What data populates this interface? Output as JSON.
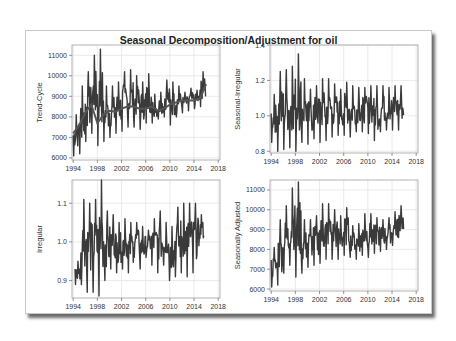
{
  "title": "Seasonal Decomposition/Adjustment  for oil",
  "colors": {
    "line": "#3a3a3a",
    "trend": "#555555",
    "grid": "#e4e4e4",
    "axis": "#a0a0a0"
  },
  "chart_data": [
    {
      "type": "line",
      "panel": "top-left",
      "ylabel": "Trend-Cycle",
      "xlabel": "",
      "x_ticks": [
        1994,
        1998,
        2002,
        2006,
        2010,
        2014,
        2018
      ],
      "y_ticks": [
        6000,
        7000,
        8000,
        9000,
        10000,
        11000
      ],
      "xlim": [
        1993.8,
        2018.3
      ],
      "ylim": [
        5900,
        11500
      ],
      "series": [
        {
          "name": "Original",
          "x_start": 1994,
          "x_end": 2016,
          "peaks": [
            8100,
            9500,
            10200,
            11000,
            11300,
            9500,
            9500,
            9700,
            10200,
            10300,
            10000,
            9700,
            10100,
            9100,
            9200,
            9800,
            9700,
            9500,
            9200,
            9400,
            9300,
            10200
          ],
          "troughs": [
            6100,
            6200,
            6800,
            7200,
            6600,
            6800,
            7000,
            7200,
            7300,
            7500,
            7500,
            7400,
            7700,
            7700,
            7900,
            8000,
            7600,
            8000,
            8200,
            8300,
            8400,
            8500
          ]
        },
        {
          "name": "Trend-Cycle",
          "points": [
            [
              1994,
              7200
            ],
            [
              1995,
              7600
            ],
            [
              1996,
              8200
            ],
            [
              1997,
              8600
            ],
            [
              1998,
              7700
            ],
            [
              1999,
              8100
            ],
            [
              2000,
              8300
            ],
            [
              2001,
              8250
            ],
            [
              2002,
              8400
            ],
            [
              2003,
              8500
            ],
            [
              2004,
              8500
            ],
            [
              2005,
              8400
            ],
            [
              2006,
              8400
            ],
            [
              2007,
              8500
            ],
            [
              2008,
              8300
            ],
            [
              2009,
              8400
            ],
            [
              2010,
              8600
            ],
            [
              2011,
              8700
            ],
            [
              2012,
              8800
            ],
            [
              2013,
              8800
            ],
            [
              2014,
              8800
            ],
            [
              2015,
              8900
            ],
            [
              2016,
              9600
            ]
          ]
        }
      ]
    },
    {
      "type": "line",
      "panel": "top-right",
      "ylabel": "Seasonal-Irregular",
      "xlabel": "",
      "x_ticks": [
        1994,
        1998,
        2002,
        2006,
        2010,
        2014,
        2018
      ],
      "y_ticks": [
        0.8,
        1.0,
        1.2,
        1.4
      ],
      "xlim": [
        1993.8,
        2018.3
      ],
      "ylim": [
        0.79,
        1.4
      ],
      "series": [
        {
          "name": "Seasonal-Irregular",
          "x_start": 1994,
          "x_end": 2016,
          "peaks": [
            1.12,
            1.25,
            1.26,
            1.28,
            1.35,
            1.21,
            1.15,
            1.17,
            1.21,
            1.21,
            1.18,
            1.15,
            1.19,
            1.17,
            1.16,
            1.16,
            1.17,
            1.17,
            1.17,
            1.16,
            1.17,
            1.17
          ],
          "troughs": [
            0.85,
            0.8,
            0.81,
            0.82,
            0.8,
            0.85,
            0.84,
            0.87,
            0.85,
            0.86,
            0.88,
            0.89,
            0.89,
            0.88,
            0.91,
            0.91,
            0.9,
            0.86,
            0.91,
            0.92,
            0.92,
            0.92
          ]
        }
      ]
    },
    {
      "type": "line",
      "panel": "bottom-left",
      "ylabel": "Irregular",
      "xlabel": "",
      "x_ticks": [
        1994,
        1998,
        2002,
        2006,
        2010,
        2014,
        2018
      ],
      "y_ticks": [
        0.9,
        1.0,
        1.1
      ],
      "xlim": [
        1993.8,
        2018.3
      ],
      "ylim": [
        0.855,
        1.16
      ],
      "series": [
        {
          "name": "Irregular",
          "x_start": 1994.3,
          "x_end": 2015.7,
          "peaks": [
            0.95,
            1.11,
            1.1,
            1.11,
            1.16,
            1.08,
            1.07,
            1.05,
            1.06,
            1.05,
            1.05,
            1.04,
            1.03,
            1.06,
            1.08,
            1.05,
            1.04,
            1.09,
            1.1,
            1.1,
            1.1,
            1.07
          ],
          "troughs": [
            0.89,
            0.89,
            0.87,
            0.87,
            0.86,
            0.9,
            0.93,
            0.92,
            0.93,
            0.92,
            0.96,
            0.93,
            0.96,
            0.94,
            0.92,
            0.94,
            0.9,
            0.91,
            0.92,
            0.91,
            0.92,
            0.99
          ]
        }
      ]
    },
    {
      "type": "line",
      "panel": "bottom-right",
      "ylabel": "Seasonally Adjusted",
      "xlabel": "",
      "x_ticks": [
        1994,
        1998,
        2002,
        2006,
        2010,
        2014,
        2018
      ],
      "y_ticks": [
        6000,
        7000,
        8000,
        9000,
        10000,
        11000
      ],
      "xlim": [
        1993.8,
        2018.3
      ],
      "ylim": [
        5900,
        11500
      ],
      "series": [
        {
          "name": "Seasonally Adjusted",
          "x_start": 1994,
          "x_end": 2016,
          "peaks": [
            8100,
            9500,
            10200,
            11100,
            11400,
            9500,
            9500,
            9700,
            10300,
            10300,
            10000,
            9700,
            10100,
            9200,
            9300,
            9800,
            9800,
            9600,
            9500,
            9600,
            9900,
            10200
          ],
          "troughs": [
            6100,
            6200,
            6800,
            7200,
            6600,
            6800,
            7100,
            7200,
            7300,
            7500,
            7500,
            7500,
            7700,
            7600,
            7500,
            7700,
            7600,
            7800,
            7900,
            8000,
            8200,
            8600
          ]
        }
      ]
    }
  ]
}
